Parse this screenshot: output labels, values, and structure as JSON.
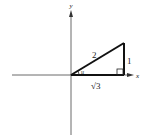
{
  "diagram": {
    "type": "right-triangle-on-axes",
    "axes": {
      "x_label": "x",
      "y_label": "y"
    },
    "triangle": {
      "hypotenuse_label": "2",
      "opposite_label": "1",
      "adjacent_label": "√3",
      "angle_label": "u",
      "right_angle_marker": true
    },
    "colors": {
      "stroke": "#111111",
      "axis": "#333333",
      "background": "#ffffff"
    }
  }
}
